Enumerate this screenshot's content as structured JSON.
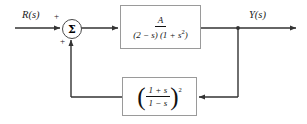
{
  "diagram": {
    "background_color": "#ffffff",
    "line_color": "#333333",
    "block_border_color": "#9a9a9a"
  },
  "input": {
    "label": "R(s)"
  },
  "output": {
    "label": "Y(s)"
  },
  "summing_junction": {
    "symbol": "Σ",
    "sign_top": "+",
    "sign_bottom": "+"
  },
  "forward_block": {
    "numerator": "A",
    "denominator_factor_1": "(2 − s)",
    "denominator_factor_2": "(1 + s",
    "denominator_exponent": "2",
    "denominator_close": ")",
    "expression": "A / [(2 − s)(1 + s²)]"
  },
  "feedback_block": {
    "open_paren": "(",
    "numerator": "1 + s",
    "denominator": "1 − s",
    "close_paren": ")",
    "exponent": "2",
    "expression": "((1 + s)/(1 − s))²"
  }
}
